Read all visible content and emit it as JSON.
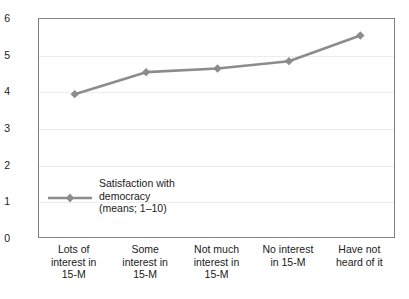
{
  "chart_data": {
    "type": "line",
    "title": "",
    "xlabel": "",
    "ylabel": "",
    "ylim": [
      0,
      6
    ],
    "yticks": [
      "0",
      "1",
      "2",
      "3",
      "4",
      "5",
      "6"
    ],
    "grid": true,
    "legend_position": "inside-lower-left",
    "categories": [
      "Lots of\ninterest in\n15-M",
      "Some\ninterest in\n15-M",
      "Not much\ninterest in\n15-M",
      "No interest\nin 15-M",
      "Have not\nheard of it"
    ],
    "series": [
      {
        "name": "Satisfaction with\ndemocracy\n(means; 1–10)",
        "values": [
          3.95,
          4.55,
          4.65,
          4.85,
          5.55
        ],
        "color": "#8c8c8c",
        "marker": "diamond"
      }
    ]
  },
  "legend": {
    "entry_label": "Satisfaction with\ndemocracy\n(means; 1–10)"
  },
  "colors": {
    "series": "#8c8c8c",
    "frame": "#808080",
    "grid": "#ededed",
    "text": "#1a1a1a"
  }
}
